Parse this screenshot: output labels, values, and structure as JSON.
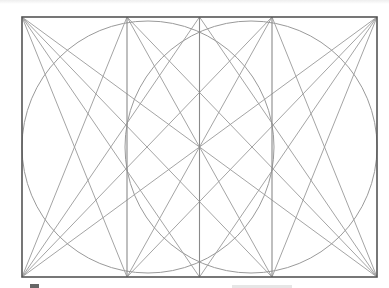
{
  "diagram": {
    "frame": {
      "x": 22,
      "y": 17,
      "width": 355,
      "height": 260
    },
    "vertical_lines_x": [
      127,
      199.5,
      272
    ],
    "circles": [
      {
        "name": "left-circle",
        "cx": 148,
        "cy": 147,
        "r": 126
      },
      {
        "name": "right-circle",
        "cx": 251,
        "cy": 147,
        "r": 126
      }
    ],
    "diagonals": [
      {
        "from": [
          22,
          17
        ],
        "to": [
          127,
          277
        ]
      },
      {
        "from": [
          22,
          17
        ],
        "to": [
          199.5,
          277
        ]
      },
      {
        "from": [
          22,
          17
        ],
        "to": [
          272,
          277
        ]
      },
      {
        "from": [
          22,
          17
        ],
        "to": [
          377,
          277
        ]
      },
      {
        "from": [
          377,
          17
        ],
        "to": [
          272,
          277
        ]
      },
      {
        "from": [
          377,
          17
        ],
        "to": [
          199.5,
          277
        ]
      },
      {
        "from": [
          377,
          17
        ],
        "to": [
          127,
          277
        ]
      },
      {
        "from": [
          377,
          17
        ],
        "to": [
          22,
          277
        ]
      },
      {
        "from": [
          22,
          277
        ],
        "to": [
          127,
          17
        ]
      },
      {
        "from": [
          22,
          277
        ],
        "to": [
          199.5,
          17
        ]
      },
      {
        "from": [
          22,
          277
        ],
        "to": [
          272,
          17
        ]
      },
      {
        "from": [
          377,
          277
        ],
        "to": [
          272,
          17
        ]
      },
      {
        "from": [
          377,
          277
        ],
        "to": [
          199.5,
          17
        ]
      },
      {
        "from": [
          377,
          277
        ],
        "to": [
          127,
          17
        ]
      },
      {
        "from": [
          127,
          17
        ],
        "to": [
          272,
          277
        ]
      },
      {
        "from": [
          272,
          17
        ],
        "to": [
          127,
          277
        ]
      }
    ],
    "colors": {
      "frame": "#555555",
      "lines": "#9a9a9a",
      "background": "#ffffff"
    }
  }
}
